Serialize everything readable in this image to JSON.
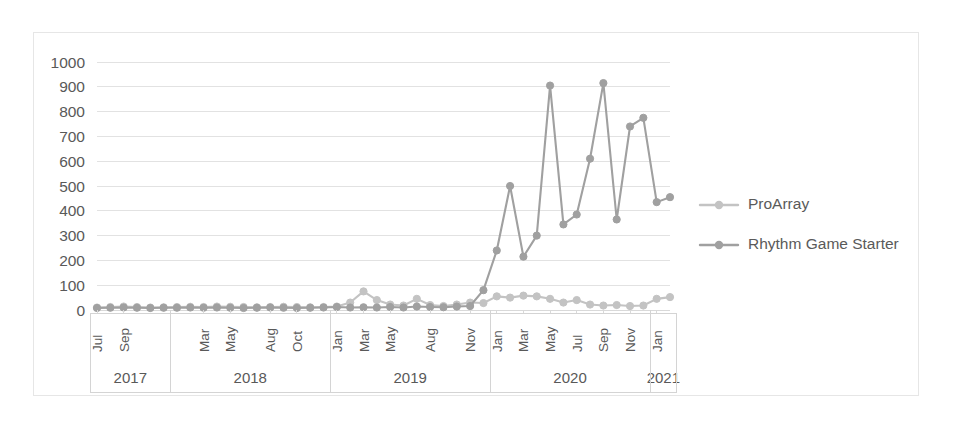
{
  "chart_data": {
    "type": "line",
    "title": "",
    "xlabel": "",
    "ylabel": "",
    "ylim": [
      0,
      1000
    ],
    "ytick_step": 100,
    "yticks": [
      "1000",
      "900",
      "800",
      "700",
      "600",
      "500",
      "400",
      "300",
      "200",
      "100",
      "0"
    ],
    "grid": true,
    "legend_position": "right",
    "x": [
      "Jul 2017",
      "Aug 2017",
      "Sep 2017",
      "Oct 2017",
      "Nov 2017",
      "Dec 2017",
      "Jan 2018",
      "Feb 2018",
      "Mar 2018",
      "Apr 2018",
      "May 2018",
      "Jun 2018",
      "Jul 2018",
      "Aug 2018",
      "Sep 2018",
      "Oct 2018",
      "Nov 2018",
      "Dec 2018",
      "Jan 2019",
      "Feb 2019",
      "Mar 2019",
      "Apr 2019",
      "May 2019",
      "Jun 2019",
      "Jul 2019",
      "Aug 2019",
      "Sep 2019",
      "Oct 2019",
      "Nov 2019",
      "Dec 2019",
      "Jan 2020",
      "Feb 2020",
      "Mar 2020",
      "Apr 2020",
      "May 2020",
      "Jun 2020",
      "Jul 2020",
      "Aug 2020",
      "Sep 2020",
      "Oct 2020",
      "Nov 2020",
      "Dec 2020",
      "Jan 2021",
      "Feb 2021"
    ],
    "xtick_labels": [
      {
        "index": 0,
        "label": "Jul"
      },
      {
        "index": 2,
        "label": "Sep"
      },
      {
        "index": 8,
        "label": "Mar"
      },
      {
        "index": 10,
        "label": "May"
      },
      {
        "index": 13,
        "label": "Aug"
      },
      {
        "index": 15,
        "label": "Oct"
      },
      {
        "index": 18,
        "label": "Jan"
      },
      {
        "index": 20,
        "label": "Mar"
      },
      {
        "index": 22,
        "label": "May"
      },
      {
        "index": 25,
        "label": "Aug"
      },
      {
        "index": 28,
        "label": "Nov"
      },
      {
        "index": 30,
        "label": "Jan"
      },
      {
        "index": 32,
        "label": "Mar"
      },
      {
        "index": 34,
        "label": "May"
      },
      {
        "index": 36,
        "label": "Jul"
      },
      {
        "index": 38,
        "label": "Sep"
      },
      {
        "index": 40,
        "label": "Nov"
      },
      {
        "index": 42,
        "label": "Jan"
      }
    ],
    "year_groups": [
      {
        "label": "2017",
        "start": 0,
        "end": 5
      },
      {
        "label": "2018",
        "start": 6,
        "end": 17
      },
      {
        "label": "2019",
        "start": 18,
        "end": 29
      },
      {
        "label": "2020",
        "start": 30,
        "end": 41
      },
      {
        "label": "2021",
        "start": 42,
        "end": 43
      }
    ],
    "series": [
      {
        "name": "ProArray",
        "color": "#c3c3c3",
        "marker": "circle",
        "values": [
          10,
          12,
          14,
          12,
          10,
          11,
          12,
          13,
          12,
          14,
          13,
          12,
          11,
          12,
          13,
          12,
          11,
          12,
          14,
          30,
          75,
          40,
          22,
          18,
          45,
          20,
          16,
          22,
          30,
          28,
          55,
          50,
          58,
          55,
          45,
          30,
          40,
          22,
          18,
          20,
          16,
          18,
          45,
          52
        ]
      },
      {
        "name": "Rhythm Game Starter",
        "color": "#a0a0a0",
        "marker": "circle",
        "values": [
          8,
          9,
          10,
          9,
          8,
          9,
          9,
          10,
          9,
          10,
          9,
          8,
          9,
          10,
          9,
          8,
          9,
          10,
          12,
          10,
          11,
          10,
          12,
          10,
          14,
          12,
          11,
          14,
          16,
          80,
          240,
          500,
          215,
          300,
          905,
          345,
          385,
          610,
          915,
          365,
          740,
          775,
          435,
          455
        ]
      }
    ]
  },
  "legend": {
    "items": [
      {
        "label": "ProArray",
        "color": "#c3c3c3"
      },
      {
        "label": "Rhythm Game Starter",
        "color": "#a0a0a0"
      }
    ]
  }
}
